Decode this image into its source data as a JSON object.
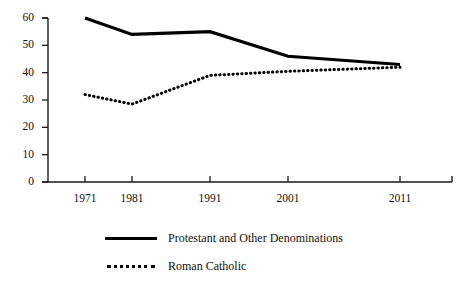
{
  "chart_data": {
    "type": "line",
    "title": "",
    "subtitle": "",
    "xlabel": "",
    "ylabel": "",
    "categories": [
      "1971",
      "1981",
      "1991",
      "2001",
      "2011"
    ],
    "x": [
      1971,
      1981,
      1991,
      2001,
      2011
    ],
    "series": [
      {
        "name": "Protestant and Other Denominations",
        "style": "solid",
        "color": "#000000",
        "values": [
          60,
          54,
          55,
          46,
          43
        ]
      },
      {
        "name": "Roman Catholic",
        "style": "dotted",
        "color": "#000000",
        "values": [
          32,
          28.5,
          39,
          40.5,
          42
        ]
      }
    ],
    "ylim": [
      0,
      60
    ],
    "yticks": [
      0,
      10,
      20,
      30,
      40,
      50,
      60
    ],
    "ytick_labels": [
      "0",
      "10",
      "20",
      "30",
      "40",
      "50",
      "60"
    ],
    "xtick_labels": [
      "1971",
      "1981",
      "1991",
      "2001",
      "2011"
    ],
    "grid": false,
    "legend_position": "bottom-left"
  },
  "axis": {
    "y_labels": [
      "60",
      "50",
      "40",
      "30",
      "20",
      "10",
      "0"
    ],
    "x_labels": [
      "1971",
      "1981",
      "1991",
      "2001",
      "2011"
    ]
  },
  "legend": {
    "items": [
      {
        "label": "Protestant and Other Denominations",
        "style": "solid"
      },
      {
        "label": "Roman Catholic",
        "style": "dotted"
      }
    ]
  }
}
